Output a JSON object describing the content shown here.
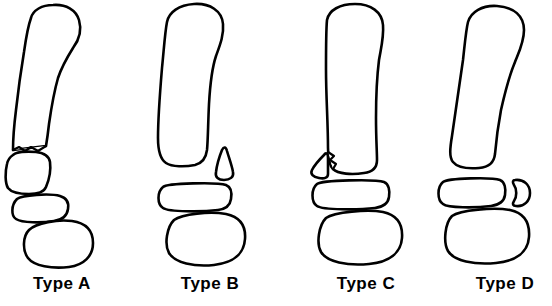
{
  "figure": {
    "background_color": "#ffffff",
    "line_color": "#000000",
    "style": "black outline line art, white fill"
  },
  "panels": [
    {
      "id": "type-a",
      "label": "Type A",
      "pattern": "transverse fracture through the distal shaft with displacement and angulation of the distal segment",
      "fragment": "none",
      "fragment_side": "none"
    },
    {
      "id": "type-b",
      "label": "Type B",
      "pattern": "fracture with a separate triangular fragment on the lateral side of the distal end",
      "fragment": "teardrop-triangular fragment",
      "fragment_side": "lateral-right"
    },
    {
      "id": "type-c",
      "label": "Type C",
      "pattern": "fracture with a separate triangular fragment on the medial side of the distal end",
      "fragment": "triangular fragment",
      "fragment_side": "medial-left"
    },
    {
      "id": "type-d",
      "label": "Type D",
      "pattern": "intact distal end with a separate crescent-shaped fragment lateral to the middle joint bone",
      "fragment": "crescent D-shaped fragment",
      "fragment_side": "lateral-right"
    }
  ]
}
